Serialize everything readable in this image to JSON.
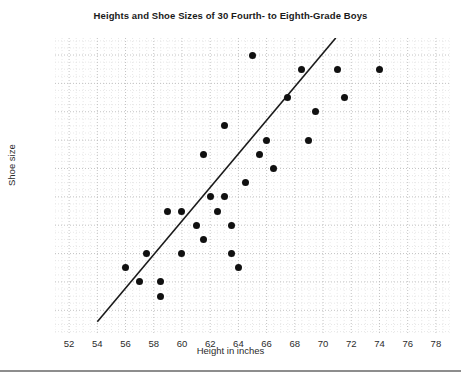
{
  "chart_data": {
    "type": "scatter",
    "title": "Heights and Shoe Sizes of 30 Fourth- to Eighth-Grade Boys",
    "xlabel": "Height in inches",
    "ylabel": "Shoe size",
    "xlim": [
      51,
      79
    ],
    "ylim": [
      2.2,
      12.6
    ],
    "xticks": [
      52,
      54,
      56,
      58,
      60,
      62,
      64,
      66,
      68,
      70,
      72,
      74,
      76,
      78
    ],
    "yticks": [
      3,
      4,
      5,
      6,
      7,
      8,
      9,
      10,
      11,
      12
    ],
    "grid": true,
    "grid_minor": true,
    "legend": "none",
    "n_points": 30,
    "points": [
      {
        "x": 56.0,
        "y": 4.5
      },
      {
        "x": 57.0,
        "y": 4.0
      },
      {
        "x": 57.5,
        "y": 5.0
      },
      {
        "x": 58.5,
        "y": 4.0
      },
      {
        "x": 58.5,
        "y": 3.5
      },
      {
        "x": 59.0,
        "y": 6.5
      },
      {
        "x": 60.0,
        "y": 6.5
      },
      {
        "x": 60.0,
        "y": 5.0
      },
      {
        "x": 61.0,
        "y": 6.0
      },
      {
        "x": 61.5,
        "y": 8.5
      },
      {
        "x": 61.5,
        "y": 5.5
      },
      {
        "x": 62.0,
        "y": 7.0
      },
      {
        "x": 62.5,
        "y": 6.5
      },
      {
        "x": 63.0,
        "y": 7.0
      },
      {
        "x": 63.0,
        "y": 9.5
      },
      {
        "x": 63.5,
        "y": 6.0
      },
      {
        "x": 63.5,
        "y": 5.0
      },
      {
        "x": 64.0,
        "y": 4.5
      },
      {
        "x": 65.0,
        "y": 12.0
      },
      {
        "x": 65.5,
        "y": 8.5
      },
      {
        "x": 66.0,
        "y": 9.0
      },
      {
        "x": 66.5,
        "y": 8.0
      },
      {
        "x": 67.5,
        "y": 10.5
      },
      {
        "x": 68.5,
        "y": 11.5
      },
      {
        "x": 69.0,
        "y": 9.0
      },
      {
        "x": 69.5,
        "y": 10.0
      },
      {
        "x": 71.0,
        "y": 11.5
      },
      {
        "x": 71.5,
        "y": 10.5
      },
      {
        "x": 74.0,
        "y": 11.5
      },
      {
        "x": 64.5,
        "y": 7.5
      }
    ],
    "trend_line": {
      "label": "line of best fit",
      "x_start": 54.0,
      "y_start": 2.6,
      "x_end": 70.9,
      "y_end": 12.6,
      "color": "#1a1a1a"
    }
  }
}
